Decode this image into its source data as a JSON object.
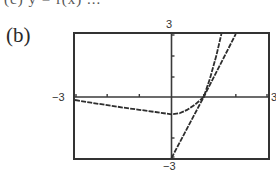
{
  "header": {
    "clipped_text": "(c)  y = f(x) ..."
  },
  "part_label": "(b)",
  "window_labels": {
    "ymax": "3",
    "ymin": "−3",
    "xmin": "−3",
    "xmax": "3"
  },
  "colors": {
    "curve": "#2e2e2e",
    "axis": "#3a3a3a",
    "frame": "#333333",
    "background": "#ffffff"
  },
  "chart_data": {
    "type": "line",
    "title": "",
    "xlabel": "",
    "ylabel": "",
    "xlim": [
      -3,
      3
    ],
    "ylim": [
      -3,
      3
    ],
    "grid": false,
    "legend": null,
    "axis_ticks": {
      "x": [
        -2,
        -1,
        1,
        2
      ],
      "y": [
        -2,
        -1,
        1,
        2
      ]
    },
    "annotations": [
      "(b)",
      "3",
      "−3",
      "−3",
      "3"
    ],
    "series": [
      {
        "name": "curve",
        "style": "dotted-dark",
        "x": [
          -3,
          -2.5,
          -2,
          -1.5,
          -1,
          -0.5,
          0,
          0.25,
          0.5,
          0.75,
          1,
          1.2,
          1.4,
          1.55
        ],
        "y": [
          -0.15,
          -0.28,
          -0.4,
          -0.52,
          -0.63,
          -0.74,
          -0.85,
          -0.8,
          -0.62,
          -0.35,
          0,
          0.9,
          2.0,
          3.0
        ]
      },
      {
        "name": "tangent line",
        "style": "dotted-dark",
        "x": [
          0,
          1,
          2
        ],
        "y": [
          -3,
          0,
          3
        ]
      }
    ],
    "intersection": {
      "x": 1,
      "y": 0
    }
  }
}
